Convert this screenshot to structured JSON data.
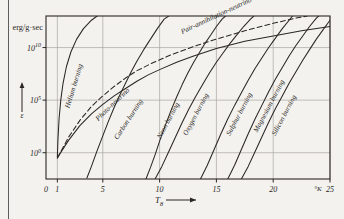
{
  "figure": {
    "background": "#f3f2ef",
    "ink": "#2a2724",
    "grid_color": "#a9a6a0"
  },
  "chart_data": {
    "type": "line",
    "title": "",
    "subtitle": "",
    "xlabel": "T_8",
    "ylabel": "ε",
    "y_unit_label": "erg/g·sec",
    "x_unit_label": "°K",
    "xlim": [
      0,
      25
    ],
    "ylim": [
      -2.5,
      13
    ],
    "x_ticks": [
      0,
      1,
      5,
      10,
      15,
      20,
      25
    ],
    "x_tick_labels": [
      "0",
      "1",
      "5",
      "10",
      "15",
      "20",
      "25"
    ],
    "y_ticks": [
      10,
      5,
      0
    ],
    "y_tick_labels": [
      "10¹⁰",
      "10⁵",
      "10⁰"
    ],
    "y_tick_mantissas": [
      "10",
      "10",
      "10"
    ],
    "y_tick_exponents": [
      "10",
      "5",
      "0"
    ],
    "grid": true,
    "grid_axis": "both",
    "legend": "inline-curve-labels",
    "x_axis_arrow": true,
    "y_axis_arrow": true,
    "series": [
      {
        "name": "Helium burning",
        "style": "solid",
        "label": "Helium burning",
        "label_x": 2.05,
        "label_y": 4.2,
        "label_angle": -73,
        "points": [
          [
            1.0,
            -0.4
          ],
          [
            1.05,
            1.2
          ],
          [
            1.15,
            3.2
          ],
          [
            1.3,
            5.0
          ],
          [
            1.5,
            6.6
          ],
          [
            1.8,
            8.2
          ],
          [
            2.2,
            9.6
          ],
          [
            2.7,
            10.8
          ],
          [
            3.3,
            11.8
          ],
          [
            4.0,
            12.6
          ],
          [
            4.5,
            13.0
          ]
        ]
      },
      {
        "name": "Photo-neutrino",
        "style": "solid",
        "label": "Photo-neutrino",
        "label_x": 4.6,
        "label_y": 3.0,
        "label_angle": -44,
        "points": [
          [
            1.0,
            -0.5
          ],
          [
            1.4,
            0.2
          ],
          [
            2.0,
            1.2
          ],
          [
            3.0,
            2.6
          ],
          [
            4.0,
            3.7
          ],
          [
            5.0,
            4.6
          ],
          [
            6.0,
            5.4
          ],
          [
            7.0,
            6.1
          ],
          [
            8.0,
            6.8
          ],
          [
            9.0,
            7.4
          ],
          [
            10.0,
            7.9
          ],
          [
            11.5,
            8.6
          ],
          [
            13.0,
            9.2
          ],
          [
            15.0,
            9.9
          ],
          [
            17.5,
            10.6
          ],
          [
            20.0,
            11.1
          ],
          [
            22.5,
            11.6
          ],
          [
            25.0,
            12.0
          ]
        ]
      },
      {
        "name": "Carbon burning",
        "style": "solid",
        "label": "Carbon burning",
        "label_x": 6.3,
        "label_y": 1.2,
        "label_angle": -57,
        "points": [
          [
            3.6,
            -2.4
          ],
          [
            4.0,
            -1.3
          ],
          [
            4.5,
            0.2
          ],
          [
            5.0,
            1.6
          ],
          [
            5.5,
            3.0
          ],
          [
            6.0,
            4.3
          ],
          [
            6.5,
            5.5
          ],
          [
            7.0,
            6.6
          ],
          [
            7.5,
            7.7
          ],
          [
            8.0,
            8.7
          ],
          [
            8.6,
            9.8
          ],
          [
            9.2,
            10.8
          ],
          [
            9.8,
            11.8
          ],
          [
            10.4,
            12.7
          ],
          [
            10.8,
            13.0
          ]
        ]
      },
      {
        "name": "Pair-annihilation-neutrino",
        "style": "dashed",
        "label": "Pair-annihilation-neutrino",
        "label_x": 12.0,
        "label_y": 11.3,
        "label_angle": -25,
        "points": [
          [
            1.0,
            -0.5
          ],
          [
            2.0,
            1.5
          ],
          [
            3.0,
            3.1
          ],
          [
            4.0,
            4.4
          ],
          [
            5.0,
            5.4
          ],
          [
            6.0,
            6.3
          ],
          [
            7.0,
            7.1
          ],
          [
            8.0,
            7.8
          ],
          [
            9.5,
            8.6
          ],
          [
            11.0,
            9.3
          ],
          [
            13.0,
            10.1
          ],
          [
            15.0,
            10.8
          ],
          [
            17.5,
            11.6
          ],
          [
            20.0,
            12.3
          ],
          [
            22.0,
            12.8
          ],
          [
            23.0,
            13.0
          ]
        ]
      },
      {
        "name": "Neon burning",
        "style": "solid",
        "label": "Neon burning",
        "label_x": 10.1,
        "label_y": 1.3,
        "label_angle": -62,
        "points": [
          [
            8.8,
            -2.5
          ],
          [
            9.2,
            -1.4
          ],
          [
            9.6,
            -0.2
          ],
          [
            10.0,
            1.1
          ],
          [
            10.5,
            2.6
          ],
          [
            11.0,
            4.0
          ],
          [
            11.5,
            5.3
          ],
          [
            12.0,
            6.5
          ],
          [
            12.5,
            7.6
          ],
          [
            13.0,
            8.6
          ],
          [
            13.5,
            9.5
          ],
          [
            14.0,
            10.4
          ],
          [
            14.5,
            11.2
          ],
          [
            15.0,
            12.0
          ],
          [
            15.5,
            12.7
          ],
          [
            15.8,
            13.0
          ]
        ]
      },
      {
        "name": "Oxygen burning",
        "style": "solid",
        "label": "Oxygen burning",
        "label_x": 12.4,
        "label_y": 1.6,
        "label_angle": -62,
        "points": [
          [
            9.6,
            -2.5
          ],
          [
            10.2,
            -1.3
          ],
          [
            10.8,
            0.1
          ],
          [
            11.4,
            1.5
          ],
          [
            12.0,
            2.9
          ],
          [
            12.6,
            4.2
          ],
          [
            13.2,
            5.4
          ],
          [
            13.8,
            6.5
          ],
          [
            14.4,
            7.6
          ],
          [
            15.0,
            8.6
          ],
          [
            15.6,
            9.5
          ],
          [
            16.2,
            10.4
          ],
          [
            16.8,
            11.2
          ],
          [
            17.4,
            12.0
          ],
          [
            18.0,
            12.7
          ],
          [
            18.3,
            13.0
          ]
        ]
      },
      {
        "name": "Sulphur burning",
        "style": "solid",
        "label": "Sulphur burning",
        "label_x": 16.2,
        "label_y": 1.6,
        "label_angle": -62,
        "points": [
          [
            13.6,
            -2.5
          ],
          [
            14.2,
            -1.2
          ],
          [
            14.8,
            0.3
          ],
          [
            15.4,
            1.8
          ],
          [
            16.0,
            3.2
          ],
          [
            16.6,
            4.5
          ],
          [
            17.2,
            5.7
          ],
          [
            17.8,
            6.9
          ],
          [
            18.4,
            8.0
          ],
          [
            19.0,
            9.0
          ],
          [
            19.6,
            10.0
          ],
          [
            20.2,
            10.9
          ],
          [
            20.8,
            11.8
          ],
          [
            21.4,
            12.6
          ],
          [
            21.7,
            13.0
          ]
        ]
      },
      {
        "name": "Magnesium burning",
        "style": "solid",
        "label": "Magnesium burning",
        "label_x": 18.6,
        "label_y": 1.9,
        "label_angle": -62,
        "points": [
          [
            16.0,
            -2.5
          ],
          [
            16.6,
            -1.2
          ],
          [
            17.2,
            0.3
          ],
          [
            17.8,
            1.8
          ],
          [
            18.4,
            3.2
          ],
          [
            19.0,
            4.5
          ],
          [
            19.6,
            5.8
          ],
          [
            20.2,
            7.0
          ],
          [
            20.8,
            8.1
          ],
          [
            21.4,
            9.2
          ],
          [
            22.0,
            10.2
          ],
          [
            22.6,
            11.1
          ],
          [
            23.2,
            12.0
          ],
          [
            23.8,
            12.8
          ],
          [
            24.0,
            13.0
          ]
        ]
      },
      {
        "name": "Silicon burning",
        "style": "solid",
        "label": "Silicon burning",
        "label_x": 20.2,
        "label_y": 1.6,
        "label_angle": -62,
        "points": [
          [
            17.2,
            -2.5
          ],
          [
            17.8,
            -1.3
          ],
          [
            18.4,
            0.1
          ],
          [
            19.0,
            1.5
          ],
          [
            19.6,
            2.9
          ],
          [
            20.2,
            4.2
          ],
          [
            20.8,
            5.4
          ],
          [
            21.4,
            6.6
          ],
          [
            22.0,
            7.7
          ],
          [
            22.6,
            8.8
          ],
          [
            23.2,
            9.8
          ],
          [
            23.8,
            10.8
          ],
          [
            24.4,
            11.7
          ],
          [
            25.0,
            12.6
          ]
        ]
      }
    ]
  }
}
